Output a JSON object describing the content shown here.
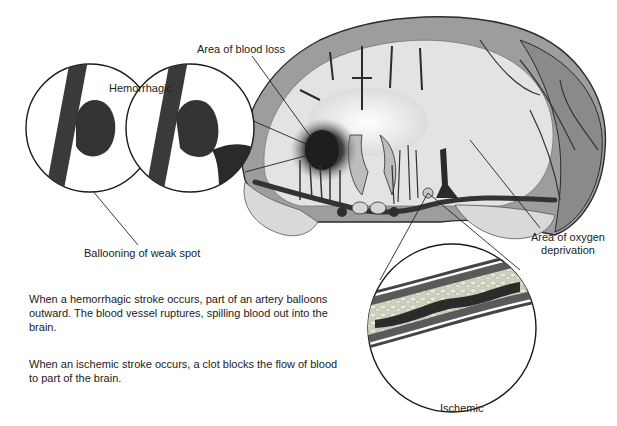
{
  "labels": {
    "area_blood_loss": "Area of blood loss",
    "hemorrhagic": "Hemorrhagic",
    "ballooning": "Ballooning of weak spot",
    "area_oxygen_line1": "Area of oxygen",
    "area_oxygen_line2": "deprivation",
    "ischemic": "Ischemic"
  },
  "paragraphs": {
    "hemorrhagic": "When a hemorrhagic stroke occurs, part of an artery balloons outward. The blood vessel ruptures, spilling blood out into the brain.",
    "ischemic": "When an ischemic stroke occurs, a clot blocks the flow of blood to part of the brain."
  },
  "colors": {
    "ink": "#1f1f1f",
    "vessel": "#3a3a3a",
    "brain_gray": "#a9a9a9",
    "white_matter": "#e6e6e6",
    "blood": "#2a2a2a",
    "plaque": "#d2d2c4"
  }
}
